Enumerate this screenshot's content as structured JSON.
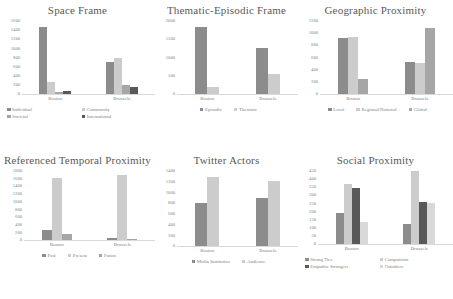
{
  "palette": {
    "s1": "#8c8c8c",
    "s2": "#cccccc",
    "s3": "#595959",
    "s4": "#d9d9d9"
  },
  "charts": [
    {
      "id": "space-frame",
      "title": "Space Frame",
      "type": "bar",
      "categories": [
        "Boston",
        "Brussels"
      ],
      "series": [
        {
          "name": "Individual",
          "color": "#8c8c8c",
          "values": [
            1390,
            665
          ]
        },
        {
          "name": "Community",
          "color": "#cccccc",
          "values": [
            250,
            745
          ]
        },
        {
          "name": "Societal",
          "color": "#a6a6a6",
          "values": [
            45,
            190
          ]
        },
        {
          "name": "International",
          "color": "#595959",
          "values": [
            60,
            145
          ]
        }
      ],
      "yticks": [
        "1600",
        "1400",
        "1200",
        "1000",
        "800",
        "600",
        "400",
        "200",
        "0"
      ],
      "ylim": [
        0,
        1600
      ],
      "legend_layout": "two-col"
    },
    {
      "id": "thematic-episodic-frame",
      "title": "Thematic-Episodic Frame",
      "type": "bar",
      "categories": [
        "Boston",
        "Brussels"
      ],
      "series": [
        {
          "name": "Episodic",
          "color": "#8c8c8c",
          "values": [
            1730,
            1205
          ]
        },
        {
          "name": "Thematic",
          "color": "#cccccc",
          "values": [
            180,
            530
          ]
        }
      ],
      "yticks": [
        "2000",
        "1500",
        "1000",
        "500",
        "0"
      ],
      "ylim": [
        0,
        2000
      ],
      "legend_layout": "row"
    },
    {
      "id": "geographic-proximity",
      "title": "Geographic Proximity",
      "type": "bar",
      "categories": [
        "Boston",
        "Brussels"
      ],
      "series": [
        {
          "name": "Local",
          "color": "#8c8c8c",
          "values": [
            870,
            500
          ]
        },
        {
          "name": "Regional/National",
          "color": "#cccccc",
          "values": [
            895,
            478
          ]
        },
        {
          "name": "Global",
          "color": "#a6a6a6",
          "values": [
            230,
            1030
          ]
        }
      ],
      "yticks": [
        "1200",
        "1000",
        "800",
        "600",
        "400",
        "200",
        "0"
      ],
      "ylim": [
        0,
        1200
      ],
      "legend_layout": "row"
    },
    {
      "id": "referenced-temporal-proximity",
      "title": "Referenced Temporal Proximity",
      "type": "bar",
      "categories": [
        "Boston",
        "Brussels"
      ],
      "series": [
        {
          "name": "Past",
          "color": "#8c8c8c",
          "values": [
            255,
            60
          ]
        },
        {
          "name": "Present",
          "color": "#cccccc",
          "values": [
            1520,
            1610
          ]
        },
        {
          "name": "Future",
          "color": "#a6a6a6",
          "values": [
            150,
            18
          ]
        }
      ],
      "yticks": [
        "1800",
        "1600",
        "1400",
        "1200",
        "1000",
        "800",
        "600",
        "400",
        "200",
        "0"
      ],
      "ylim": [
        0,
        1800
      ],
      "legend_layout": "row"
    },
    {
      "id": "twitter-actors",
      "title": "Twitter Actors",
      "type": "bar",
      "categories": [
        "Boston",
        "Brussels"
      ],
      "series": [
        {
          "name": "Media Institution",
          "color": "#8c8c8c",
          "values": [
            770,
            845
          ]
        },
        {
          "name": "Audience",
          "color": "#cccccc",
          "values": [
            1220,
            1150
          ]
        }
      ],
      "yticks": [
        "1400",
        "1200",
        "1000",
        "800",
        "600",
        "400",
        "200",
        "0"
      ],
      "ylim": [
        0,
        1400
      ],
      "legend_layout": "row"
    },
    {
      "id": "social-proximity",
      "title": "Social Proximity",
      "type": "bar",
      "categories": [
        "Boston",
        "Brussels"
      ],
      "series": [
        {
          "name": "Strong Ties",
          "color": "#8c8c8c",
          "values": [
            180,
            118
          ]
        },
        {
          "name": "Compatriots",
          "color": "#cccccc",
          "values": [
            350,
            425
          ]
        },
        {
          "name": "Empathic Strangers",
          "color": "#595959",
          "values": [
            325,
            247
          ]
        },
        {
          "name": "Outsiders",
          "color": "#d9d9d9",
          "values": [
            130,
            237
          ]
        }
      ],
      "yticks": [
        "450",
        "400",
        "350",
        "300",
        "250",
        "200",
        "150",
        "100",
        "50",
        "0"
      ],
      "ylim": [
        0,
        450
      ],
      "legend_layout": "two-col"
    }
  ]
}
